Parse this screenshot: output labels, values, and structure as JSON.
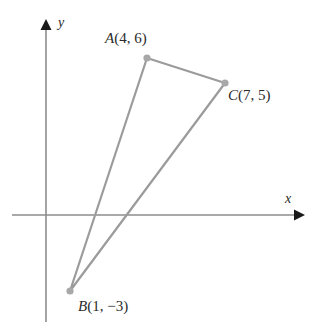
{
  "figure": {
    "kind": "coordinate-plane-triangle",
    "axes": {
      "x_label": "x",
      "y_label": "y",
      "origin_px": [
        46,
        215
      ],
      "x_axis_px": [
        12,
        300
      ],
      "y_axis_px": [
        322,
        22
      ],
      "units_per_pixel_x": 25.7,
      "units_per_pixel_y": 25.9,
      "color": "#8d8d8d",
      "arrow_color": "#1a1a1a",
      "ticks": false,
      "grid": false
    },
    "shape": {
      "name": "triangle-ABC",
      "stroke_color": "#9b9b9b",
      "vertex_dot_color": "#a8a8a8",
      "closed": true,
      "vertices": [
        {
          "name": "A",
          "letter": "A",
          "coords": "(4, 6)",
          "label": "A(4, 6)",
          "x": 4,
          "y": 6,
          "px": [
            147,
            58
          ],
          "label_px": [
            105,
            31
          ]
        },
        {
          "name": "B",
          "letter": "B",
          "coords": "(1, −3)",
          "label": "B(1, −3)",
          "x": 1,
          "y": -3,
          "px": [
            70,
            291
          ],
          "label_px": [
            78,
            299
          ]
        },
        {
          "name": "C",
          "letter": "C",
          "coords": "(7, 5)",
          "label": "C(7, 5)",
          "x": 7,
          "y": 5,
          "px": [
            225,
            83
          ],
          "label_px": [
            228,
            88
          ]
        }
      ],
      "edges": [
        {
          "name": "edge-AC",
          "from": "A",
          "to": "C"
        },
        {
          "name": "edge-CB",
          "from": "C",
          "to": "B"
        },
        {
          "name": "edge-BA",
          "from": "B",
          "to": "A"
        }
      ]
    }
  }
}
